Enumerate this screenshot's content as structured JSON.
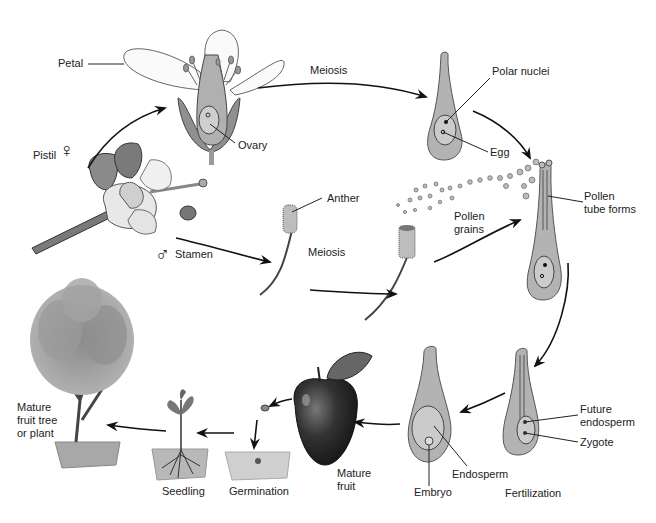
{
  "diagram": {
    "colors": {
      "background": "#ffffff",
      "structure_fill": "#b5b5b5",
      "inner_fill": "#cfcfcf",
      "outline": "#555555",
      "arrow": "#111111",
      "text": "#222222"
    },
    "symbols": {
      "female": "♀",
      "male": "♂"
    },
    "labels": {
      "petal": "Petal",
      "ovary": "Ovary",
      "pistil": "Pistil",
      "stamen": "Stamen",
      "meiosis_top": "Meiosis",
      "meiosis_bottom": "Meiosis",
      "polar_nuclei": "Polar nuclei",
      "egg": "Egg",
      "anther": "Anther",
      "pollen_grains": "Pollen\ngrains",
      "pollen_tube_forms": "Pollen\ntube forms",
      "future_endosperm": "Future\nendosperm",
      "zygote": "Zygote",
      "fertilization": "Fertilization",
      "endosperm": "Endosperm",
      "embryo": "Embryo",
      "mature_fruit": "Mature\nfruit",
      "germination": "Germination",
      "seedling": "Seedling",
      "mature_tree": "Mature\nfruit tree\nor plant"
    },
    "stages": [
      "Flower (Pistil / Stamen)",
      "Meiosis",
      "Embryo sac (Polar nuclei, Egg)",
      "Pollen grains",
      "Pollen tube forms",
      "Fertilization",
      "Embryo / Endosperm",
      "Mature fruit",
      "Germination",
      "Seedling",
      "Mature fruit tree or plant"
    ]
  }
}
